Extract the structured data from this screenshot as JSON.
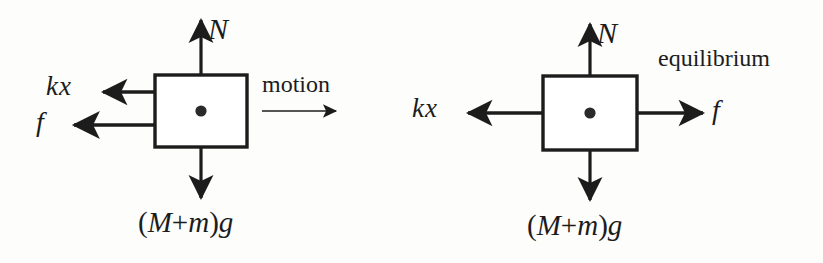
{
  "figure": {
    "background_color": "#fdfdfb",
    "stroke_color": "#1c1c1c",
    "dot_color": "#2a2a2a"
  },
  "diagrams": [
    {
      "id": "motion",
      "caption": "motion",
      "block": {
        "x": 155,
        "y": 75,
        "width": 92,
        "height": 72
      },
      "center_dot": {
        "cx": 201,
        "cy": 111,
        "r": 5.5
      },
      "forces": [
        {
          "name": "normal-force",
          "label": "N",
          "direction": "up"
        },
        {
          "name": "spring-force",
          "label": "kx",
          "direction": "left"
        },
        {
          "name": "friction-force",
          "label": "f",
          "direction": "left"
        },
        {
          "name": "weight-force",
          "label": "(M + m)g",
          "direction": "down"
        }
      ],
      "weight_parts": {
        "open": "(",
        "mass1": "M",
        "plus": "+",
        "mass2": "m",
        "close": ")",
        "gravity": "g"
      }
    },
    {
      "id": "equilibrium",
      "caption": "equilibrium",
      "block": {
        "x": 543,
        "y": 76,
        "width": 94,
        "height": 74
      },
      "center_dot": {
        "cx": 590,
        "cy": 113,
        "r": 5.5
      },
      "forces": [
        {
          "name": "normal-force",
          "label": "N",
          "direction": "up"
        },
        {
          "name": "spring-force",
          "label": "kx",
          "direction": "left"
        },
        {
          "name": "friction-force",
          "label": "f",
          "direction": "right"
        },
        {
          "name": "weight-force",
          "label": "(M + m)g",
          "direction": "down"
        }
      ],
      "weight_parts": {
        "open": "(",
        "mass1": "M",
        "plus": "+",
        "mass2": "m",
        "close": ")",
        "gravity": "g"
      }
    }
  ],
  "labels": {
    "left_N": "N",
    "left_kx": "kx",
    "left_f": "f",
    "left_motion": "motion",
    "left_weight_open": "(",
    "left_weight_M": "M",
    "left_weight_plus": "+",
    "left_weight_m": "m",
    "left_weight_close": ")",
    "left_weight_g": "g",
    "right_N": "N",
    "right_kx": "kx",
    "right_f": "f",
    "right_equilibrium": "equilibrium",
    "right_weight_open": "(",
    "right_weight_M": "M",
    "right_weight_plus": "+",
    "right_weight_m": "m",
    "right_weight_close": ")",
    "right_weight_g": "g"
  }
}
